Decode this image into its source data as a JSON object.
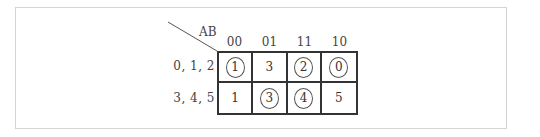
{
  "diagram": {
    "corner_label": "AB",
    "columns": [
      "00",
      "01",
      "11",
      "10"
    ],
    "rows": [
      {
        "label": "0, 1, 2",
        "cells": [
          {
            "value": "1",
            "circled": true
          },
          {
            "value": "3",
            "circled": false
          },
          {
            "value": "2",
            "circled": true
          },
          {
            "value": "0",
            "circled": true
          }
        ]
      },
      {
        "label": "3, 4, 5",
        "cells": [
          {
            "value": "1",
            "circled": false
          },
          {
            "value": "3",
            "circled": true
          },
          {
            "value": "4",
            "circled": true
          },
          {
            "value": "5",
            "circled": false
          }
        ]
      }
    ]
  }
}
